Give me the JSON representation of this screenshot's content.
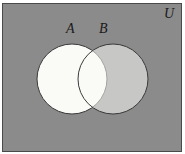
{
  "figure": {
    "type": "venn-diagram",
    "background_color": "#ffffff"
  },
  "universe": {
    "label": "U",
    "fill_color": "#8b8b8b",
    "border_color": "#4a4a4a"
  },
  "sets": [
    {
      "label": "A",
      "fill_color": "#fafaf7",
      "stroke_color": "#3a3a3a",
      "cx": 72,
      "cy": 79,
      "r": 35
    },
    {
      "label": "B",
      "fill_color": "#fafaf7",
      "stroke_color": "#3a3a3a",
      "cx": 113,
      "cy": 79,
      "r": 35
    }
  ]
}
